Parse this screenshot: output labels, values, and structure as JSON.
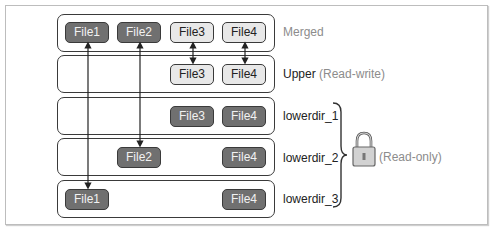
{
  "layers": [
    {
      "id": "merged",
      "label": "Merged",
      "label_suffix": "",
      "files": [
        {
          "name": "File1",
          "style": "dark"
        },
        {
          "name": "File2",
          "style": "dark"
        },
        {
          "name": "File3",
          "style": "light"
        },
        {
          "name": "File4",
          "style": "light"
        }
      ]
    },
    {
      "id": "upper",
      "label": "Upper",
      "label_suffix": "(Read-write)",
      "files": [
        {
          "name": "File3",
          "style": "light"
        },
        {
          "name": "File4",
          "style": "light"
        }
      ]
    },
    {
      "id": "lowerdir_1",
      "label": "lowerdir_1",
      "label_suffix": "",
      "files": [
        {
          "name": "File3",
          "style": "dark"
        },
        {
          "name": "File4",
          "style": "dark"
        }
      ]
    },
    {
      "id": "lowerdir_2",
      "label": "lowerdir_2",
      "label_suffix": "",
      "files": [
        {
          "name": "File2",
          "style": "dark"
        },
        {
          "name": "File4",
          "style": "dark"
        }
      ]
    },
    {
      "id": "lowerdir_3",
      "label": "lowerdir_3",
      "label_suffix": "",
      "files": [
        {
          "name": "File1",
          "style": "dark"
        },
        {
          "name": "File4",
          "style": "dark"
        }
      ]
    }
  ],
  "readonly_group": {
    "icon": "lock-icon",
    "label": "(Read-only)"
  },
  "arrows": [
    {
      "from": "merged.File1",
      "to": "lowerdir_3.File1",
      "direction": "both"
    },
    {
      "from": "merged.File2",
      "to": "lowerdir_2.File2",
      "direction": "both"
    },
    {
      "from": "merged.File3",
      "to": "upper.File3",
      "direction": "both"
    },
    {
      "from": "merged.File4",
      "to": "upper.File4",
      "direction": "both"
    }
  ],
  "colors": {
    "dark_file": "#707070",
    "light_file": "#e8e8e8",
    "border": "#3a3a3a",
    "muted_text": "#8c8c8c"
  }
}
